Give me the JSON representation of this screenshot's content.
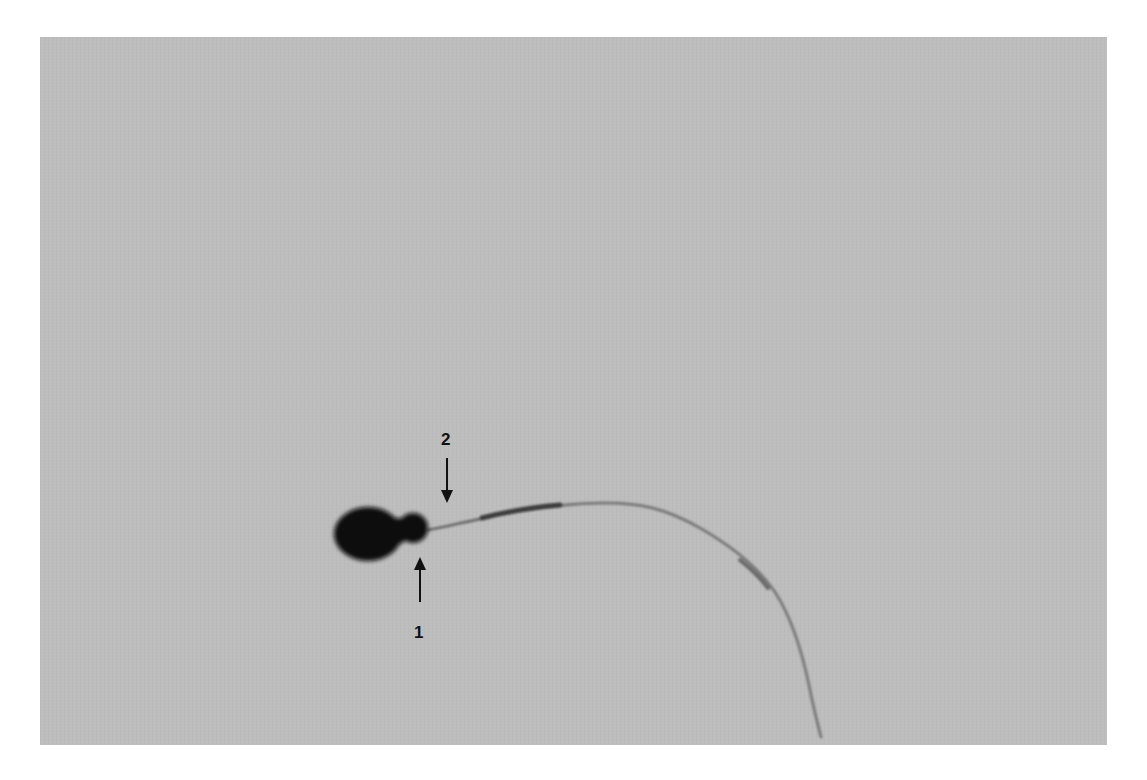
{
  "image": {
    "subject": "spermatozoon micrograph",
    "background_color": "#bdbdbd",
    "specimen_color": "#0a0a0a"
  },
  "annotations": [
    {
      "label": "1",
      "arrow_direction": "up"
    },
    {
      "label": "2",
      "arrow_direction": "down"
    }
  ]
}
